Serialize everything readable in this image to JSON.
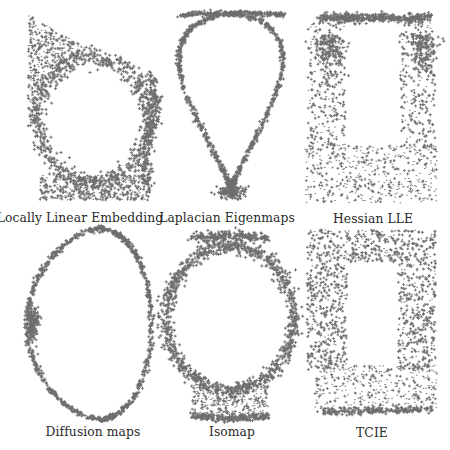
{
  "figure": {
    "type": "scatter-grid",
    "point_color": "#6e6e6e",
    "panels": [
      {
        "id": "lle",
        "caption": "Locally Linear Embedding",
        "caption_x": 80,
        "caption_y": 212
      },
      {
        "id": "laplacian",
        "caption": "Laplacian Eigenmaps",
        "caption_x": 227,
        "caption_y": 212
      },
      {
        "id": "hessian",
        "caption": "Hessian LLE",
        "caption_x": 373,
        "caption_y": 212
      },
      {
        "id": "diffusion",
        "caption": "Diffusion maps",
        "caption_x": 93,
        "caption_y": 426
      },
      {
        "id": "isomap",
        "caption": "Isomap",
        "caption_x": 232,
        "caption_y": 426
      },
      {
        "id": "tcie",
        "caption": "TCIE",
        "caption_x": 372,
        "caption_y": 426
      }
    ]
  },
  "chart_data": [
    {
      "type": "scatter",
      "title": "Locally Linear Embedding",
      "shape": "distorted ring with dense bottom band (fishbowl embedding)",
      "bbox": [
        25,
        14,
        160,
        202
      ]
    },
    {
      "type": "scatter",
      "title": "Laplacian Eigenmaps",
      "shape": "thin teardrop loop, dense cluster at bottom tip",
      "bbox": [
        165,
        12,
        297,
        203
      ]
    },
    {
      "type": "scatter",
      "title": "Hessian LLE",
      "shape": "rectangular frame with dense top edge, filled bottom",
      "bbox": [
        305,
        14,
        437,
        203
      ]
    },
    {
      "type": "scatter",
      "title": "Diffusion maps",
      "shape": "thin D-shaped loop, cluster at left tip",
      "bbox": [
        25,
        228,
        158,
        419
      ]
    },
    {
      "type": "scatter",
      "title": "Isomap",
      "shape": "circular ring with filled square base",
      "bbox": [
        163,
        228,
        298,
        417
      ]
    },
    {
      "type": "scatter",
      "title": "TCIE",
      "shape": "rectangular frame with filled bottom",
      "bbox": [
        305,
        228,
        441,
        419
      ]
    }
  ]
}
